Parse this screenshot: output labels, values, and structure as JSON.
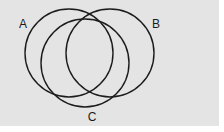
{
  "diagram": {
    "type": "venn",
    "background": "#e4e4e4",
    "stroke_color": "#1c1c1c",
    "sets": [
      {
        "id": "A",
        "label": "A",
        "cx": 69,
        "cy": 53,
        "r": 44,
        "label_x": 23,
        "label_y": 28
      },
      {
        "id": "B",
        "label": "B",
        "cx": 110,
        "cy": 53,
        "r": 44,
        "label_x": 156,
        "label_y": 28
      },
      {
        "id": "C",
        "label": "C",
        "cx": 85,
        "cy": 63,
        "r": 44,
        "label_x": 92,
        "label_y": 121
      }
    ]
  }
}
